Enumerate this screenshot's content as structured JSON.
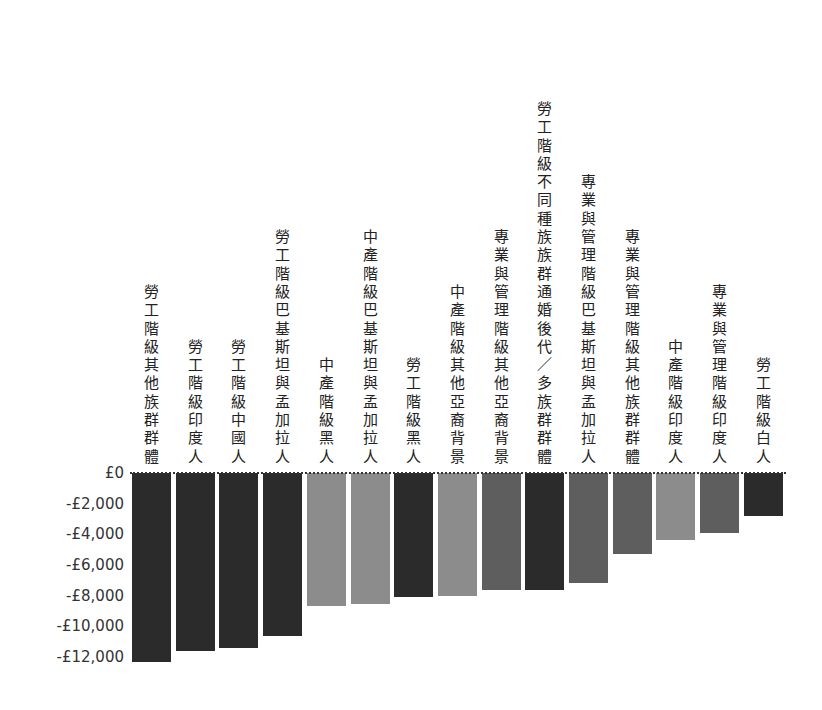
{
  "chart_data": {
    "type": "bar",
    "title": "",
    "xlabel": "",
    "ylabel": "",
    "ylim": [
      -12500,
      0
    ],
    "yticks": [
      0,
      -2000,
      -4000,
      -6000,
      -8000,
      -10000,
      -12000
    ],
    "ytick_labels": [
      "£0",
      "-£2,000",
      "-£4,000",
      "-£6,000",
      "-£8,000",
      "-£10,000",
      "-£12,000"
    ],
    "grid": false,
    "legend": null,
    "categories": [
      "勞工階級其他族群群體",
      "勞工階級印度人",
      "勞工階級中國人",
      "勞工階級巴基斯坦與孟加拉人",
      "中產階級黑人",
      "中產階級巴基斯坦與孟加拉人",
      "勞工階級黑人",
      "中產階級其他亞裔背景",
      "專業與管理階級其他亞裔背景",
      "勞工階級不同種族族群通婚後代／多族群群體",
      "專業與管理階級巴基斯坦與孟加拉人",
      "專業與管理階級其他族群群體",
      "中產階級印度人",
      "專業與管理階級印度人",
      "勞工階級白人"
    ],
    "values": [
      -12300,
      -11600,
      -11400,
      -10600,
      -8700,
      -8550,
      -8100,
      -8000,
      -7600,
      -7600,
      -7200,
      -5300,
      -4400,
      -3900,
      -2800
    ],
    "colors": [
      "#2b2b2b",
      "#2b2b2b",
      "#2b2b2b",
      "#2b2b2b",
      "#8c8c8c",
      "#8c8c8c",
      "#2b2b2b",
      "#8c8c8c",
      "#5e5e5e",
      "#2b2b2b",
      "#5e5e5e",
      "#5e5e5e",
      "#8c8c8c",
      "#5e5e5e",
      "#2b2b2b"
    ],
    "class_colors": {
      "勞工階級": "#2b2b2b",
      "中產階級": "#8c8c8c",
      "專業與管理階級": "#5e5e5e"
    }
  }
}
